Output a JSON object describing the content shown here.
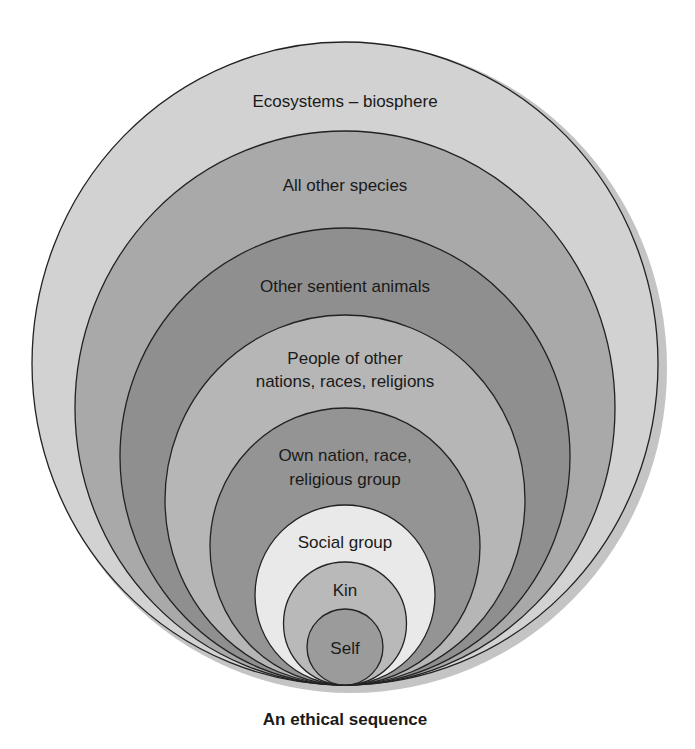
{
  "diagram": {
    "type": "nested-circles",
    "caption": "An ethical sequence",
    "layers": [
      {
        "label": "Ecosystems – biosphere",
        "fill": "#d2d2d2"
      },
      {
        "label": "All other species",
        "fill": "#a9a9a9"
      },
      {
        "label": "Other sentient animals",
        "fill": "#8f8f8f"
      },
      {
        "label_line1": "People of other",
        "label_line2": "nations, races, religions",
        "fill": "#b6b6b6"
      },
      {
        "label_line1": "Own nation, race,",
        "label_line2": "religious group",
        "fill": "#949494"
      },
      {
        "label": "Social group",
        "fill": "#e9e9e9"
      },
      {
        "label": "Kin",
        "fill": "#b9b9b9"
      },
      {
        "label": "Self",
        "fill": "#9b9b9b"
      }
    ],
    "outline_color": "#222222",
    "shadow_color": "#c4c4c4"
  }
}
